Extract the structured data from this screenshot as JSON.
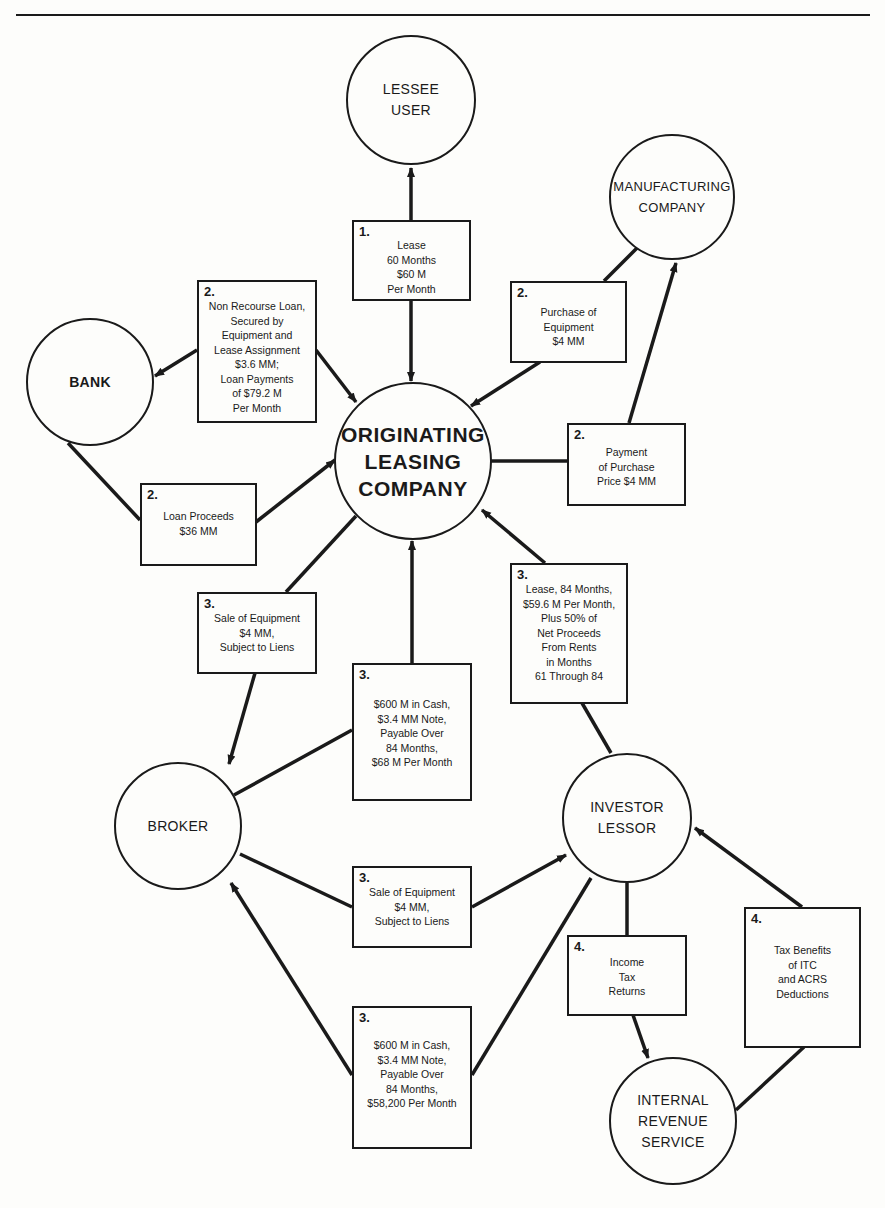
{
  "nodes": {
    "lessee": {
      "lines": [
        "LESSEE",
        "USER"
      ]
    },
    "manufacturing": {
      "lines": [
        "MANUFACTURING",
        "COMPANY"
      ]
    },
    "bank": {
      "lines": [
        "BANK"
      ]
    },
    "originating": {
      "lines": [
        "ORIGINATING",
        "LEASING",
        "COMPANY"
      ]
    },
    "broker": {
      "lines": [
        "BROKER"
      ]
    },
    "investor": {
      "lines": [
        "INVESTOR",
        "LESSOR"
      ]
    },
    "irs": {
      "lines": [
        "INTERNAL",
        "REVENUE",
        "SERVICE"
      ]
    }
  },
  "boxes": {
    "lease": {
      "step": "1.",
      "lines": [
        "Lease",
        "60 Months",
        "$60 M",
        "Per Month"
      ]
    },
    "nonrecourse_loan": {
      "step": "2.",
      "lines": [
        "Non Recourse Loan,",
        "Secured by",
        "Equipment and",
        "Lease Assignment",
        "$3.6 MM;",
        "Loan Payments",
        "of $79.2 M",
        "Per Month"
      ]
    },
    "purchase_equipment": {
      "step": "2.",
      "lines": [
        "Purchase of",
        "Equipment",
        "$4 MM"
      ]
    },
    "loan_proceeds": {
      "step": "2.",
      "lines": [
        "Loan Proceeds",
        "$36 MM"
      ]
    },
    "payment_purchase": {
      "step": "2.",
      "lines": [
        "Payment",
        "of Purchase",
        "Price $4 MM"
      ]
    },
    "sale_top": {
      "step": "3.",
      "lines": [
        "Sale of Equipment",
        "$4 MM,",
        "Subject to Liens"
      ]
    },
    "cash_top": {
      "step": "3.",
      "lines": [
        "$600 M in Cash,",
        "$3.4 MM Note,",
        "Payable Over",
        "84 Months,",
        "$68 M Per Month"
      ]
    },
    "lease_84": {
      "step": "3.",
      "lines": [
        "Lease, 84 Months,",
        "$59.6 M Per Month,",
        "Plus 50% of",
        "Net Proceeds",
        "From Rents",
        "in Months",
        "61 Through 84"
      ]
    },
    "sale_mid": {
      "step": "3.",
      "lines": [
        "Sale of Equipment",
        "$4 MM,",
        "Subject to Liens"
      ]
    },
    "cash_bottom": {
      "step": "3.",
      "lines": [
        "$600 M in Cash,",
        "$3.4 MM Note,",
        "Payable Over",
        "84 Months,",
        "$58,200 Per Month"
      ]
    },
    "income_tax": {
      "step": "4.",
      "lines": [
        "Income",
        "Tax",
        "Returns"
      ]
    },
    "tax_benefits": {
      "step": "4.",
      "lines": [
        "Tax Benefits",
        "of ITC",
        "and ACRS",
        "Deductions"
      ]
    }
  },
  "colors": {
    "ink": "#1a1a1a",
    "paper": "#fdfdfb"
  }
}
